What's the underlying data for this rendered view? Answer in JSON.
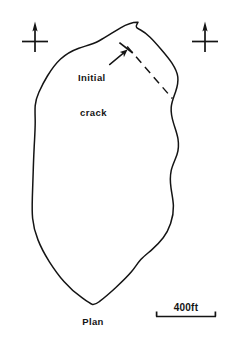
{
  "figure": {
    "kind": "engineering-plan-view-sketch",
    "caption": "Plan",
    "background_color": "#ffffff",
    "ink_color": "#141414",
    "width_px": 227,
    "height_px": 341
  },
  "annotations": {
    "crack_label": {
      "line_1": "Initial",
      "line_2": "crack",
      "full_text": "Initial crack",
      "leader": "leader-arrow-to-crack",
      "feature": "initial-crack-dashed-line"
    }
  },
  "markers": {
    "left": {
      "name": "north-arrow-cross-marker-left",
      "glyph": "cross-with-up-arrow",
      "label": ""
    },
    "right": {
      "name": "north-arrow-cross-marker-right",
      "glyph": "cross-with-up-arrow",
      "label": ""
    }
  },
  "scale_bar": {
    "value_label": "400ft",
    "length": "400",
    "unit": "ft",
    "tick_style": "upward-end-ticks"
  },
  "geometry": {
    "outline_path": "M 138.0 22.2 C 131.5 22.0 126.2 24.6 121.4 27.4 C 114.0 31.6 107.0 36.2 99.6 40.2 C 93.2 43.6 86.4 45.2 79.6 47.6 C 73.2 49.9 67.0 53.3 61.8 57.9 C 56.6 62.5 52.3 68.3 48.4 74.3 C 45.2 79.3 42.3 84.6 39.6 90.0 C 37.6 94.1 36.0 98.5 35.4 103.0 C 34.7 108.5 35.2 114.2 35.2 119.8 C 35.2 128.0 34.6 136.2 34.2 144.4 C 33.8 152.8 33.4 161.2 33.2 169.6 C 33.0 177.6 32.6 185.6 32.4 193.6 C 32.2 201.2 31.8 208.8 32.4 216.4 C 33.0 223.8 34.8 231.0 37.4 238.0 C 40.4 246.0 44.4 253.5 48.8 260.8 C 53.2 268.0 58.0 275.0 63.4 281.4 C 68.4 287.4 74.0 292.8 80.2 297.4 C 84.0 300.2 88.0 303.2 92.2 304.9 C 95.0 305.3 97.2 303.4 99.4 301.7 C 105.0 297.4 110.2 292.6 115.4 287.8 C 121.0 282.6 126.6 277.4 131.4 271.5 C 134.6 267.6 137.2 263.2 140.6 259.4 C 144.0 255.6 148.2 252.6 152.0 249.2 C 156.0 245.6 159.8 241.8 163.0 237.5 C 166.2 233.2 168.6 228.3 170.4 223.2 C 172.4 217.6 173.4 211.6 173.2 205.6 C 173.0 199.6 171.6 193.7 170.8 187.8 C 170.0 182.2 169.8 176.4 171.0 170.8 C 172.2 165.2 175.0 160.2 176.8 154.8 C 178.4 149.9 178.6 144.6 177.8 139.5 C 177.0 134.2 175.0 129.2 173.4 124.1 C 171.8 119.0 170.6 113.6 171.0 108.2 C 171.4 102.8 173.6 97.8 175.4 92.7 C 177.0 88.0 178.2 83.0 177.6 78.1 C 177.0 73.0 174.4 68.4 171.6 64.2 C 168.4 59.4 164.6 55.0 160.8 50.7 C 157.2 46.6 153.6 42.4 149.6 38.7 C 146.8 36.1 143.8 33.6 140.4 31.9 C 139.0 31.2 137.4 30.8 136.2 29.8 C 135.2 28.9 135.4 27.4 136.0 26.3 C 136.5 25.3 137.3 24.4 138.0 23.6 Z",
    "crack_line": {
      "x1": 127.6,
      "y1": 47.2,
      "x2": 172.2,
      "y2": 98.4
    },
    "crack_tick": {
      "x1": 119.6,
      "y1": 43.0,
      "x2": 132.4,
      "y2": 52.6
    },
    "leader_line": {
      "x1": 110.0,
      "y1": 63.8,
      "x2": 127.2,
      "y2": 49.6
    },
    "left_marker": {
      "cx": 35,
      "cy": 41,
      "arm": 13,
      "stem_top": 22,
      "stem_bottom": 52
    },
    "right_marker": {
      "cx": 205,
      "cy": 41,
      "arm": 13,
      "stem_top": 22,
      "stem_bottom": 52
    },
    "scale_bar_line": {
      "x1": 156,
      "y1": 316.5,
      "x2": 216,
      "y2": 316.5,
      "tick_height": 5
    }
  }
}
